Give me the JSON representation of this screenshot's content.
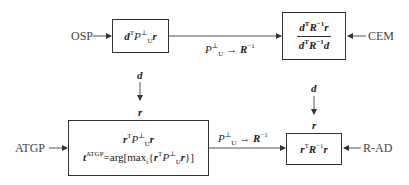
{
  "diagram": {
    "nodes": {
      "osp": {
        "label": "OSP",
        "formula": "dᵀP⊥U r"
      },
      "cem": {
        "label": "CEM",
        "numerator": "dᵀR⁻¹r",
        "denominator": "dᵀR⁻¹d"
      },
      "atgp": {
        "label": "ATGP",
        "formula_line1": "rᵀP⊥U r",
        "formula_line2": "tᴬᵀᴳᴾ=arg[maxᵣ{rᵀP⊥U r}]"
      },
      "rad": {
        "label": "R-AD",
        "formula": "rᵀR⁻¹r"
      }
    },
    "edges": {
      "top_transition": "P⊥U → R⁻¹",
      "bottom_transition": "P⊥U → R⁻¹"
    },
    "symbols": {
      "d_left": "d",
      "r_left": "r",
      "d_right": "d",
      "r_right": "r"
    },
    "colors": {
      "line": "#333333",
      "text": "#222222",
      "label": "#444444"
    }
  }
}
